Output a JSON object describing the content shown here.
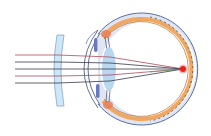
{
  "diagram": {
    "labels": [],
    "colors": {
      "background": "#ffffff",
      "corrective_lens_fill": "#cfe6f5",
      "corrective_lens_stroke": "#7fa9cf",
      "sclera_fill": "#dfe5f3",
      "sclera_stroke": "#5a6fa0",
      "choroid": "#f0a860",
      "retina_line": "#c06a2a",
      "cornea_stroke": "#3c4a7a",
      "crystalline_lens_fill": "#b9d8f0",
      "iris": "#6a78c0",
      "ciliary_body": "#e77f5a",
      "focus_point": "#e8231c",
      "ray_dark": "#3a3a4a",
      "ray_red": "#c0506a",
      "ray_green": "#4aa060"
    },
    "rays": [
      {
        "y": 55,
        "color": "#b04a5a"
      },
      {
        "y": 62,
        "color": "#3a3a4a"
      },
      {
        "y": 69,
        "color": "#3a3a4a"
      },
      {
        "y": 76,
        "color": "#b04a5a"
      },
      {
        "y": 83,
        "color": "#3a3a4a"
      }
    ],
    "focus": {
      "x": 183,
      "y": 69
    }
  }
}
